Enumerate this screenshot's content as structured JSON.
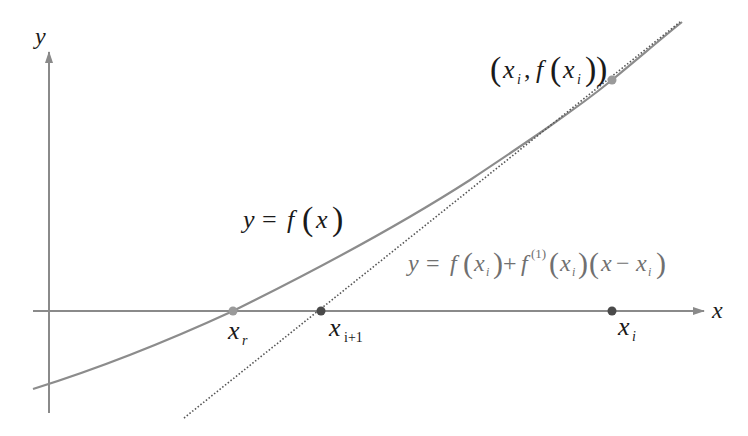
{
  "diagram": {
    "axes": {
      "x_label": "x",
      "y_label": "y"
    },
    "labels": {
      "curve_eq": {
        "lhs": "y",
        "eq": "=",
        "f": "f",
        "lp": "(",
        "x": "x",
        "rp": ")"
      },
      "tangent_eq": {
        "y": "y",
        "eq": "=",
        "f": "f",
        "x": "x",
        "i": "i",
        "plus": "+",
        "sup": "(1)",
        "minus": "−"
      },
      "point": {
        "x": "x",
        "i": "i",
        "comma": ",",
        "f": "f"
      },
      "xr": {
        "base": "x",
        "sub": "r"
      },
      "xi1": {
        "base": "x",
        "sub": "i+1"
      },
      "xi": {
        "base": "x",
        "sub": "i"
      }
    },
    "colors": {
      "axis": "#8a8a8a",
      "curve": "#8c8c8c",
      "tangent": "#555555",
      "point_light": "#9a9a9a",
      "point_dark": "#4a4a4a",
      "text": "#1a1a1a",
      "text_gray": "#707070"
    }
  }
}
